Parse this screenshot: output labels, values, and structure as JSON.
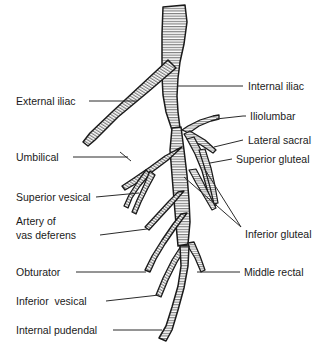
{
  "figure": {
    "type": "anatomical-line-diagram",
    "width": 324,
    "height": 353,
    "background_color": "#ffffff",
    "ink_color": "#1a1a1a",
    "vessel_fill_color": "#9a9a9a",
    "leader_color": "#2b2b2b"
  },
  "labels": {
    "internal_iliac": "Internal iliac",
    "external_iliac": "External iliac",
    "iliolumbar": "Iliolumbar",
    "lateral_sacral": "Lateral sacral",
    "superior_gluteal": "Superior gluteal",
    "umbilical": "Umbilical",
    "superior_vesical": "Superior vesical",
    "artery_of_line1": "Artery of",
    "artery_of_line2": "vas deferens",
    "inferior_gluteal": "Inferior gluteal",
    "obturator": "Obturator",
    "middle_rectal": "Middle rectal",
    "inferior_vesical": "Inferior  vesical",
    "internal_pudendal": "Internal pudendal"
  }
}
